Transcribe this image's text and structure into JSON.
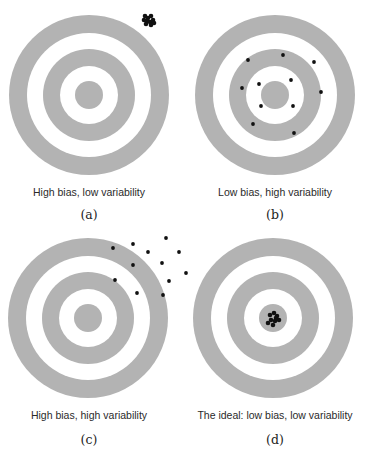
{
  "colors": {
    "ring": "#b3b3b3",
    "background": "#ffffff",
    "shot": "#111111",
    "text": "#2a2a2a"
  },
  "panels": [
    {
      "id": "a",
      "label": "(a)",
      "caption": "High bias, low variability",
      "center": [
        89,
        95
      ],
      "shots": [
        [
          145,
          16
        ],
        [
          148,
          18
        ],
        [
          151,
          16
        ],
        [
          147,
          21
        ],
        [
          150,
          22
        ],
        [
          153,
          20
        ],
        [
          146,
          24
        ],
        [
          151,
          25
        ],
        [
          154,
          23
        ],
        [
          144,
          20
        ]
      ]
    },
    {
      "id": "b",
      "label": "(b)",
      "caption": "Low bias, high variability",
      "center": [
        275,
        95
      ],
      "shots": [
        [
          283,
          55
        ],
        [
          248,
          60
        ],
        [
          314,
          62
        ],
        [
          242,
          88
        ],
        [
          259,
          84
        ],
        [
          291,
          80
        ],
        [
          321,
          92
        ],
        [
          261,
          106
        ],
        [
          293,
          106
        ],
        [
          253,
          124
        ],
        [
          294,
          133
        ]
      ]
    },
    {
      "id": "c",
      "label": "(c)",
      "caption": "High bias, high variability",
      "center": [
        88,
        318
      ],
      "shots": [
        [
          113,
          248
        ],
        [
          133,
          244
        ],
        [
          166,
          238
        ],
        [
          148,
          252
        ],
        [
          179,
          252
        ],
        [
          133,
          265
        ],
        [
          162,
          263
        ],
        [
          115,
          280
        ],
        [
          186,
          273
        ],
        [
          169,
          281
        ],
        [
          137,
          293
        ],
        [
          163,
          295
        ]
      ]
    },
    {
      "id": "d",
      "label": "(d)",
      "caption": "The ideal: low bias, low variability",
      "center": [
        273,
        318
      ],
      "shots": [
        [
          270,
          315
        ],
        [
          274,
          313
        ],
        [
          277,
          316
        ],
        [
          271,
          320
        ],
        [
          275,
          321
        ],
        [
          279,
          320
        ],
        [
          268,
          323
        ],
        [
          273,
          325
        ],
        [
          276,
          318
        ]
      ]
    }
  ],
  "rings": {
    "outer_radius": 80,
    "outer_inner_radius": 62,
    "middle_radius": 46,
    "middle_inner_radius": 29,
    "bullseye_radius": 14
  }
}
